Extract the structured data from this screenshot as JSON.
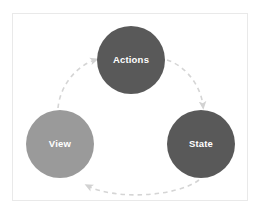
{
  "figure": {
    "background_color": "#ffffff",
    "frame_border_color": "#e9e9e9"
  },
  "diagram": {
    "type": "cycle",
    "nodes": [
      {
        "id": "actions",
        "label": "Actions",
        "fill_color": "#595959",
        "text_color": "#ffffff",
        "cx": 131,
        "cy": 60,
        "r": 34
      },
      {
        "id": "view",
        "label": "View",
        "fill_color": "#9a9a9a",
        "text_color": "#ffffff",
        "cx": 60,
        "cy": 144,
        "r": 34
      },
      {
        "id": "state",
        "label": "State",
        "fill_color": "#595959",
        "text_color": "#ffffff",
        "cx": 201,
        "cy": 144,
        "r": 34
      }
    ],
    "edges": [
      {
        "id": "view-to-actions",
        "from": "view",
        "to": "actions",
        "style": "dashed",
        "color": "#d5d5d5",
        "arrowhead": "triangle"
      },
      {
        "id": "actions-to-state",
        "from": "actions",
        "to": "state",
        "style": "dashed",
        "color": "#d5d5d5",
        "arrowhead": "triangle"
      },
      {
        "id": "state-to-view",
        "from": "state",
        "to": "view",
        "style": "dashed",
        "color": "#d5d5d5",
        "arrowhead": "triangle"
      }
    ]
  }
}
